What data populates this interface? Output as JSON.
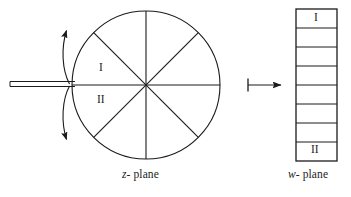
{
  "figure": {
    "type": "conformal-mapping-diagram",
    "stroke_color": "#1b1b1b",
    "background_color": "#ffffff",
    "captions": {
      "left": {
        "variable": "z",
        "suffix": "- plane"
      },
      "right": {
        "variable": "w",
        "suffix": "- plane"
      }
    },
    "z_plane": {
      "shape": "circle",
      "center": {
        "x": 146,
        "y": 85
      },
      "radius": 74,
      "sector_count": 8,
      "diameter_angles_deg": [
        0,
        45,
        90,
        135
      ],
      "slit": {
        "description": "double horizontal line entering disk from the left along negative real axis",
        "x_start": 10,
        "x_end": 75,
        "line1_y": 82,
        "line2_y": 87
      },
      "curved_arrow": {
        "description": "double-headed arc outside the left rim indicating the cut edges",
        "arrowheads": [
          "up",
          "down"
        ]
      },
      "labels": [
        {
          "text": "I",
          "position": "above-slit"
        },
        {
          "text": "II",
          "position": "below-slit"
        }
      ]
    },
    "map_arrow": {
      "glyph": "maps-to",
      "x_start": 247,
      "x_end": 282,
      "y": 85,
      "has_left_bar": true
    },
    "w_plane": {
      "shape": "rectangle-strip",
      "x": 296,
      "y": 9,
      "width": 41,
      "height": 152,
      "cell_count": 8,
      "labels": [
        {
          "text": "I",
          "position": "top-cell"
        },
        {
          "text": "II",
          "position": "bottom-cell"
        }
      ]
    }
  }
}
